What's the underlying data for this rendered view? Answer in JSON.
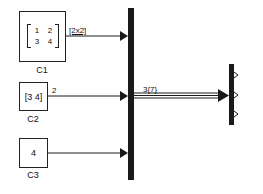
{
  "blocks": {
    "c1": {
      "name": "C1",
      "matrix": [
        [
          "1",
          "2"
        ],
        [
          "3",
          "4"
        ]
      ],
      "signal_label": "[2x2]"
    },
    "c2": {
      "name": "C2",
      "value": "[3 4]",
      "signal_label": "2"
    },
    "c3": {
      "name": "C3",
      "value": "4"
    }
  },
  "bus": {
    "signal_label": "3{7}"
  },
  "colors": {
    "line": "#1a1a1a",
    "background": "#ffffff"
  }
}
